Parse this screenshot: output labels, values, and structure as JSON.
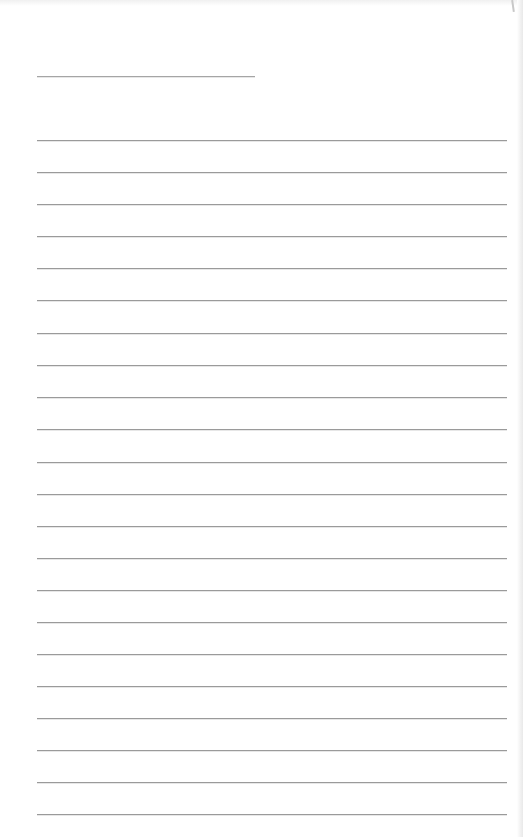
{
  "document": {
    "type": "lined-form",
    "background_color": "#ffffff",
    "line_color": "#9a9a9a",
    "header_line": {
      "x_start": 37,
      "x_end": 255,
      "y": 76
    },
    "ruled_lines": {
      "count": 22,
      "x_start": 37,
      "x_end": 507,
      "first_y": 140,
      "spacing": 32.2,
      "positions_y": [
        140,
        172,
        204,
        236,
        268,
        300,
        333,
        365,
        397,
        429,
        462,
        494,
        526,
        558,
        590,
        622,
        654,
        686,
        718,
        750,
        782,
        814
      ]
    },
    "text_content": []
  }
}
